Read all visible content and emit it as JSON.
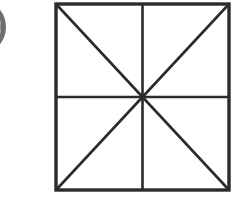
{
  "canvas": {
    "width": 234,
    "height": 207,
    "background_color": "#ffffff"
  },
  "badge": {
    "label": "0",
    "icon_name": "numbered-circle-badge",
    "shape": "circle",
    "fill_color": "#8a8a8a",
    "rim_color": "#6f6f6f",
    "label_color": "#f2f2f2",
    "clipped_edge": "left",
    "center_x": -22,
    "center_y": 27,
    "radius": 26
  },
  "figure": {
    "name": "square-with-midlines-and-diagonals",
    "stroke_color": "#2b2b2b",
    "border_stroke_width": 3.4,
    "inner_stroke_width": 2.6,
    "fill_color": "#ffffff",
    "square": {
      "left": 4,
      "top": 4,
      "width": 173,
      "height": 186
    },
    "center": {
      "x": 90.5,
      "y": 97
    },
    "region_count": 8,
    "lines": [
      {
        "name": "top-edge",
        "x1": 4,
        "y1": 4,
        "x2": 177,
        "y2": 4
      },
      {
        "name": "right-edge",
        "x1": 177,
        "y1": 4,
        "x2": 177,
        "y2": 190
      },
      {
        "name": "bottom-edge",
        "x1": 177,
        "y1": 190,
        "x2": 4,
        "y2": 190
      },
      {
        "name": "left-edge",
        "x1": 4,
        "y1": 190,
        "x2": 4,
        "y2": 4
      },
      {
        "name": "vertical-midline",
        "x1": 90.5,
        "y1": 4,
        "x2": 90.5,
        "y2": 190
      },
      {
        "name": "horizontal-midline",
        "x1": 4,
        "y1": 97,
        "x2": 177,
        "y2": 97
      },
      {
        "name": "diagonal-tl-br",
        "x1": 4,
        "y1": 4,
        "x2": 177,
        "y2": 190
      },
      {
        "name": "diagonal-tr-bl",
        "x1": 177,
        "y1": 4,
        "x2": 4,
        "y2": 190
      }
    ]
  }
}
